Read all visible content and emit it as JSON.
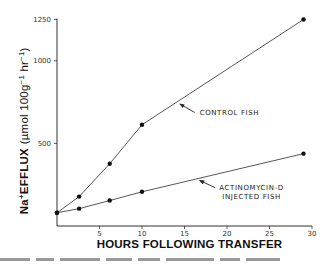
{
  "chart_data": {
    "type": "line",
    "title": "",
    "xlabel": "HOURS FOLLOWING TRANSFER",
    "ylabel": "Na⁺EFFLUX (µmol 100g⁻¹ hr⁻¹)",
    "ylabel_parts": {
      "base": "Na",
      "sup": "+",
      "rest": "EFFLUX",
      "unit_open": "(µmol 100g",
      "sup2": "−1",
      "unit_mid": " hr",
      "sup3": "−1",
      "unit_close": ")"
    },
    "xlim": [
      0,
      30
    ],
    "ylim": [
      0,
      1250
    ],
    "xticks": [
      5,
      10,
      15,
      20,
      25,
      30
    ],
    "xtick_labels": [
      "5",
      "10",
      "15",
      "20",
      "25",
      "30"
    ],
    "yticks": [
      500,
      1000,
      1250
    ],
    "ytick_labels": [
      "500",
      "1000",
      "1250"
    ],
    "grid": false,
    "legend": "none (inline annotations with arrows)",
    "series": [
      {
        "name": "CONTROL FISH",
        "x": [
          0,
          2.6,
          6.2,
          10,
          29
        ],
        "y": [
          80,
          178,
          377,
          613,
          1250
        ]
      },
      {
        "name": "ACTINOMYCIN-D INJECTED FISH",
        "x": [
          0,
          2.6,
          6.2,
          10,
          29
        ],
        "y": [
          80,
          105,
          154,
          207,
          438
        ]
      }
    ],
    "annotations": [
      {
        "text": "CONTROL FISH",
        "target_series": 0
      },
      {
        "text_line1": "ACTINOMYCIN-D",
        "text_line2": "INJECTED FISH",
        "target_series": 1
      }
    ]
  }
}
